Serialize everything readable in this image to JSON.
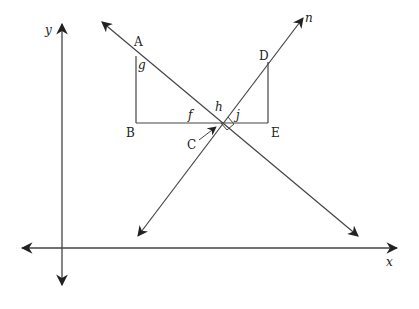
{
  "diagram": {
    "axes": {
      "x_label": "x",
      "y_label": "y"
    },
    "points": {
      "A": "A",
      "B": "B",
      "C": "C",
      "D": "D",
      "E": "E"
    },
    "angles": {
      "f": "f",
      "g": "g",
      "h": "h",
      "j": "j"
    },
    "line_label": "n",
    "stroke_color": "#333333"
  }
}
